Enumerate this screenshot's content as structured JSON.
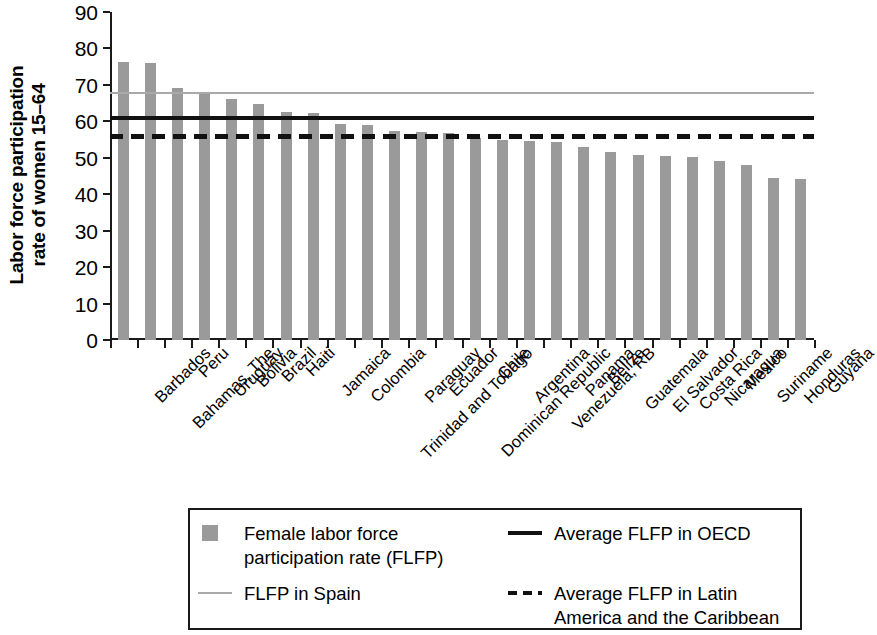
{
  "chart_data": {
    "type": "bar",
    "title": "",
    "subtitle": "",
    "xlabel": "",
    "ylabel": "Labor force participation rate of women 15–64",
    "ylabel_line1": "Labor force participation",
    "ylabel_line2": "rate of women 15–64",
    "ylim": [
      0,
      90
    ],
    "ytick_values": [
      0,
      10,
      20,
      30,
      40,
      50,
      60,
      70,
      80,
      90
    ],
    "ytick_labels": [
      "0",
      "10",
      "20",
      "30",
      "40",
      "50",
      "60",
      "70",
      "80",
      "90"
    ],
    "grid": false,
    "legend_position": "bottom",
    "bar_color": "#9a9a9a",
    "categories": [
      "Barbados",
      "Bahamas, The",
      "Peru",
      "Uruguay",
      "Bolivia",
      "Brazil",
      "Haiti",
      "Jamaica",
      "Colombia",
      "Trinidad and Tobago",
      "Paraguay",
      "Ecuador",
      "Dominican Republic",
      "Chile",
      "Argentina",
      "Venezuela, RB",
      "Panama",
      "Belize",
      "Guatemala",
      "El Salvador",
      "Costa Rica",
      "Nicaragua",
      "Mexico",
      "Suriname",
      "Honduras",
      "Guyana"
    ],
    "series": [
      {
        "name": "Female labor force participation rate (FLFP)",
        "values": [
          76.3,
          76.1,
          69.2,
          67.4,
          66.0,
          64.7,
          62.7,
          62.3,
          59.3,
          59.0,
          57.3,
          57.2,
          56.9,
          55.3,
          54.9,
          54.6,
          54.3,
          53.0,
          51.7,
          50.8,
          50.4,
          50.3,
          49.0,
          48.0,
          44.4,
          44.1
        ]
      }
    ],
    "reference_lines": [
      {
        "name": "FLFP in Spain",
        "value": 68.0,
        "style": "solid",
        "color": "#a9a9a9"
      },
      {
        "name": "Average FLFP in OECD",
        "value": 61.6,
        "style": "solid",
        "color": "#111111"
      },
      {
        "name": "Average FLFP in Latin America and the Caribbean",
        "value": 56.6,
        "style": "dashed",
        "color": "#111111"
      }
    ],
    "legend_entries": [
      {
        "id": "flfp-bar",
        "label": "Female labor force\nparticipation rate (FLFP)",
        "marker": "box",
        "color": "#9a9a9a"
      },
      {
        "id": "flfp-spain",
        "label": "FLFP in Spain",
        "marker": "line-gray",
        "color": "#a9a9a9"
      },
      {
        "id": "flfp-oecd",
        "label": "Average FLFP in OECD",
        "marker": "line-solid",
        "color": "#111111"
      },
      {
        "id": "flfp-lac",
        "label": "Average FLFP in Latin\nAmerica and the Caribbean",
        "marker": "line-dashed",
        "color": "#111111"
      }
    ]
  }
}
